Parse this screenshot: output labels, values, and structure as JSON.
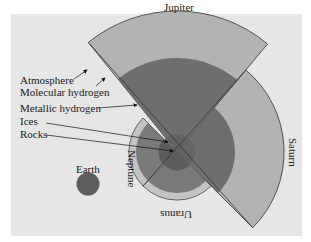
{
  "figure": {
    "labels": {
      "jupiter": "Jupiter",
      "saturn": "Saturn",
      "uranus": "Uranus",
      "neptune": "Neptune",
      "earth": "Earth"
    },
    "legend": {
      "atmosphere": "Atmosphere",
      "molecular_hydrogen": "Molecular hydrogen",
      "metallic_hydrogen": "Metallic hydrogen",
      "ices": "Ices",
      "rocks": "Rocks"
    },
    "colors": {
      "background": "#e6e6e6",
      "molecular_hydrogen": "#b3b3b3",
      "metallic_hydrogen": "#6e6e6e",
      "ices": "#7a7a7a",
      "rocks": "#5a5a5a",
      "outline": "#333333"
    }
  }
}
